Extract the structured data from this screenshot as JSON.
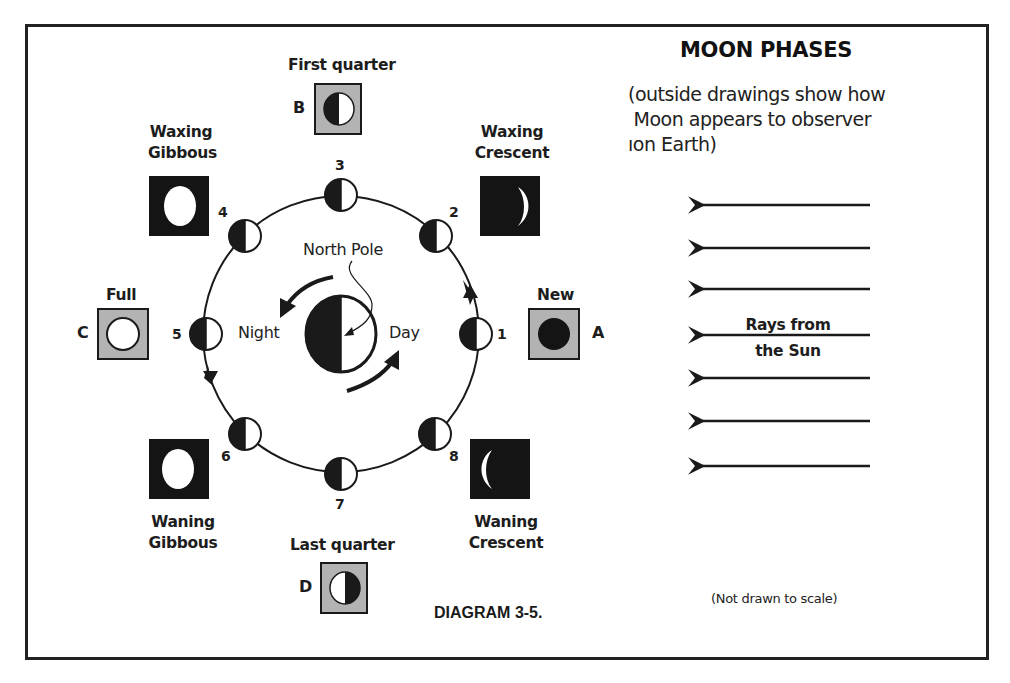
{
  "title": "MOON PHASES",
  "subtitle_lines": [
    "(outside drawings show how",
    " Moon appears to observer",
    "ıon Earth)"
  ],
  "caption": "DIAGRAM 3-5.",
  "note": "(Not drawn to scale)",
  "sun_rays": {
    "label_line1": "Rays from",
    "label_line2": "the Sun",
    "count": 7,
    "direction": "right-to-left"
  },
  "earth": {
    "north_pole_label": "North Pole",
    "night_label": "Night",
    "day_label": "Day",
    "rotation": "counterclockwise"
  },
  "orbit": {
    "direction": "counterclockwise",
    "positions": [
      {
        "number": "1",
        "angle_deg": 0
      },
      {
        "number": "2",
        "angle_deg": 45
      },
      {
        "number": "3",
        "angle_deg": 90
      },
      {
        "number": "4",
        "angle_deg": 135
      },
      {
        "number": "5",
        "angle_deg": 180
      },
      {
        "number": "6",
        "angle_deg": 225
      },
      {
        "number": "7",
        "angle_deg": 270
      },
      {
        "number": "8",
        "angle_deg": 315
      }
    ]
  },
  "phases": [
    {
      "id": "A",
      "label": "New",
      "letter": "A",
      "box_style": "gray",
      "position": "1"
    },
    {
      "id": "waxing-crescent",
      "label_line1": "Waxing",
      "label_line2": "Crescent",
      "box_style": "black",
      "position": "2"
    },
    {
      "id": "B",
      "label": "First quarter",
      "letter": "B",
      "box_style": "gray",
      "position": "3"
    },
    {
      "id": "waxing-gibbous",
      "label_line1": "Waxing",
      "label_line2": "Gibbous",
      "box_style": "black",
      "position": "4"
    },
    {
      "id": "C",
      "label": "Full",
      "letter": "C",
      "box_style": "gray",
      "position": "5"
    },
    {
      "id": "waning-gibbous",
      "label_line1": "Waning",
      "label_line2": "Gibbous",
      "box_style": "black",
      "position": "6"
    },
    {
      "id": "D",
      "label": "Last quarter",
      "letter": "D",
      "box_style": "gray",
      "position": "7"
    },
    {
      "id": "waning-crescent",
      "label_line1": "Waning",
      "label_line2": "Crescent",
      "box_style": "black",
      "position": "8"
    }
  ],
  "colors": {
    "ink": "#1a1a1a",
    "box_gray": "#b3b3b3",
    "box_black": "#141414",
    "paper": "#ffffff"
  }
}
